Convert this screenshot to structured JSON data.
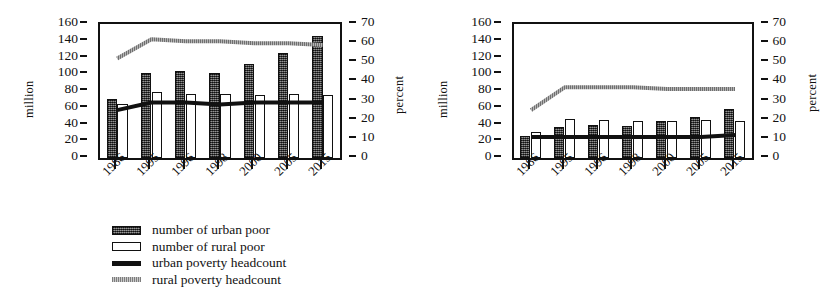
{
  "chart_data": [
    {
      "type": "bar",
      "id": "poverty",
      "title": "",
      "categories": [
        "1986",
        "1995",
        "1996",
        "1998",
        "2000",
        "2005",
        "2015"
      ],
      "xlabel": "",
      "ylabel": "million",
      "ylabel_right": "percent",
      "ylim": [
        0,
        160
      ],
      "yticks": [
        0,
        20,
        40,
        60,
        80,
        100,
        120,
        140,
        160
      ],
      "ylim_right": [
        0,
        70
      ],
      "yticks_right": [
        0,
        10,
        20,
        30,
        40,
        50,
        60,
        70
      ],
      "grid": false,
      "legend_position": "below",
      "series": [
        {
          "name": "number of urban poor",
          "kind": "bar",
          "axis": "left",
          "style": "hatched-dark",
          "values": [
            71,
            102,
            104,
            101,
            112,
            125,
            146
          ]
        },
        {
          "name": "number of rural poor",
          "kind": "bar",
          "axis": "left",
          "style": "white-outline",
          "values": [
            64,
            79,
            77,
            76,
            75,
            77,
            75
          ]
        },
        {
          "name": "urban poverty headcount",
          "kind": "line",
          "axis": "right",
          "style": "solid-black",
          "values": [
            25,
            29,
            29,
            28,
            29,
            29,
            29
          ]
        },
        {
          "name": "rural poverty headcount",
          "kind": "line",
          "axis": "right",
          "style": "dotted-gray",
          "values": [
            52,
            62,
            61,
            61,
            60,
            60,
            59
          ]
        }
      ]
    },
    {
      "type": "bar",
      "id": "extreme-poverty",
      "title": "",
      "categories": [
        "1986",
        "1995",
        "1996",
        "1998",
        "2000",
        "2005",
        "2015"
      ],
      "xlabel": "",
      "ylabel": "million",
      "ylabel_right": "percent",
      "ylim": [
        0,
        160
      ],
      "yticks": [
        0,
        20,
        40,
        60,
        80,
        100,
        120,
        140,
        160
      ],
      "ylim_right": [
        0,
        70
      ],
      "yticks_right": [
        0,
        10,
        20,
        30,
        40,
        50,
        60,
        70
      ],
      "grid": false,
      "legend_position": "below",
      "series": [
        {
          "name": "number of urban extreme poor",
          "kind": "bar",
          "axis": "left",
          "style": "hatched-dark",
          "values": [
            26,
            37,
            40,
            38,
            44,
            49,
            58
          ]
        },
        {
          "name": "number of rural extreme poor",
          "kind": "bar",
          "axis": "left",
          "style": "white-outline",
          "values": [
            31,
            46,
            45,
            44,
            44,
            45,
            44
          ]
        },
        {
          "name": "urban extreme poverty headcount",
          "kind": "line",
          "axis": "right",
          "style": "solid-black",
          "values": [
            11,
            11,
            11,
            11,
            11,
            11,
            12
          ]
        },
        {
          "name": "rural extreme poverty headcount",
          "kind": "line",
          "axis": "right",
          "style": "dotted-gray",
          "values": [
            25,
            37,
            37,
            37,
            36,
            36,
            36
          ]
        }
      ]
    }
  ],
  "panels": [
    {
      "axis_left_title": "million",
      "axis_right_title": "percent",
      "legend": [
        {
          "label": "number of urban poor",
          "swatch": "urban"
        },
        {
          "label": "number of rural poor",
          "swatch": "rural"
        },
        {
          "label": "urban poverty headcount",
          "swatch": "uline"
        },
        {
          "label": "rural poverty headcount",
          "swatch": "rline"
        }
      ]
    },
    {
      "axis_left_title": "million",
      "axis_right_title": "percent",
      "legend": [
        {
          "label": "number of urban extreme poor",
          "swatch": "urban"
        },
        {
          "label": "number of rural extreme poor",
          "swatch": "rural"
        },
        {
          "label": "urban extreme poverty headcount",
          "swatch": "uline"
        },
        {
          "label": "rural extreme poverty headcount",
          "swatch": "rline"
        }
      ]
    }
  ],
  "colors": {
    "urban_bar": "#4a4a4a",
    "rural_bar": "#ffffff",
    "urban_line": "#111111",
    "rural_line": "#9a9a9a",
    "axis": "#111111"
  }
}
